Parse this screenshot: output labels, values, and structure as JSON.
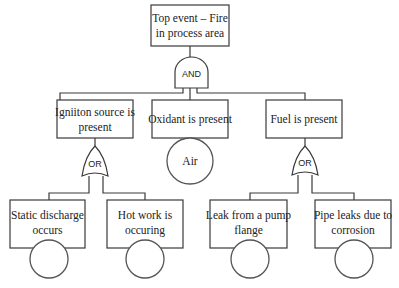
{
  "diagram": {
    "type": "fault-tree",
    "top_event": {
      "line1": "Top event – Fire",
      "line2": "in process area"
    },
    "top_gate": {
      "type": "AND",
      "label": "AND"
    },
    "intermediate_events": [
      {
        "line1": "Igniiton source is",
        "line2": "present",
        "gate": "OR"
      },
      {
        "line1": "Oxidant is present",
        "line2": "",
        "gate": null
      },
      {
        "line1": "Fuel is present",
        "line2": "",
        "gate": "OR"
      }
    ],
    "gates": {
      "left_or": {
        "label": "OR"
      },
      "right_or": {
        "label": "OR"
      }
    },
    "undeveloped_event_air": {
      "label": "Air"
    },
    "basic_events": [
      {
        "line1": "Static discharge",
        "line2": "occurs"
      },
      {
        "line1": "Hot work is",
        "line2": "occuring"
      },
      {
        "line1": "Leak from a pump",
        "line2": "flange"
      },
      {
        "line1": "Pipe leaks due to",
        "line2": "corrosion"
      }
    ]
  }
}
